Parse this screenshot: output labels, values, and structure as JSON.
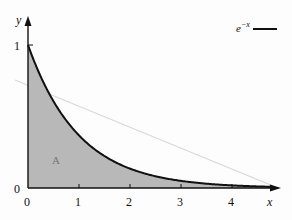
{
  "chart_data": {
    "type": "area",
    "title": "",
    "xlabel": "x",
    "ylabel": "y",
    "xlim": [
      0,
      4.8
    ],
    "ylim": [
      0,
      1.05
    ],
    "x_ticks": [
      "0",
      "1",
      "2",
      "3",
      "4"
    ],
    "y_ticks": [
      "0",
      "1"
    ],
    "grid": false,
    "legend": {
      "position": "top-right",
      "entries": [
        "e^{-x}"
      ]
    },
    "series": [
      {
        "name": "e^{-x}",
        "function": "exp(-x)",
        "x": [
          0,
          0.5,
          1,
          1.5,
          2,
          2.5,
          3,
          3.5,
          4,
          4.5
        ],
        "values": [
          1.0,
          0.607,
          0.368,
          0.223,
          0.135,
          0.082,
          0.05,
          0.03,
          0.018,
          0.011
        ],
        "fill_under": true,
        "fill_color": "#b8b8b8",
        "line_color": "#111111"
      }
    ],
    "annotations": [
      {
        "text": "A",
        "x": 0.85,
        "y": 0.2,
        "meaning": "shaded area under curve"
      }
    ],
    "faint_line": {
      "from": [
        -0.25,
        0.8
      ],
      "to": [
        4.9,
        0.0
      ],
      "color": "#d6d6d6"
    }
  },
  "labels": {
    "y_axis": "y",
    "x_axis": "x",
    "y_tick_1": "1",
    "y_tick_0": "0",
    "x_tick_0": "0",
    "x_tick_1": "1",
    "x_tick_2": "2",
    "x_tick_3": "3",
    "x_tick_4": "4",
    "region": "A",
    "legend_base": "e",
    "legend_sup": "−x"
  }
}
